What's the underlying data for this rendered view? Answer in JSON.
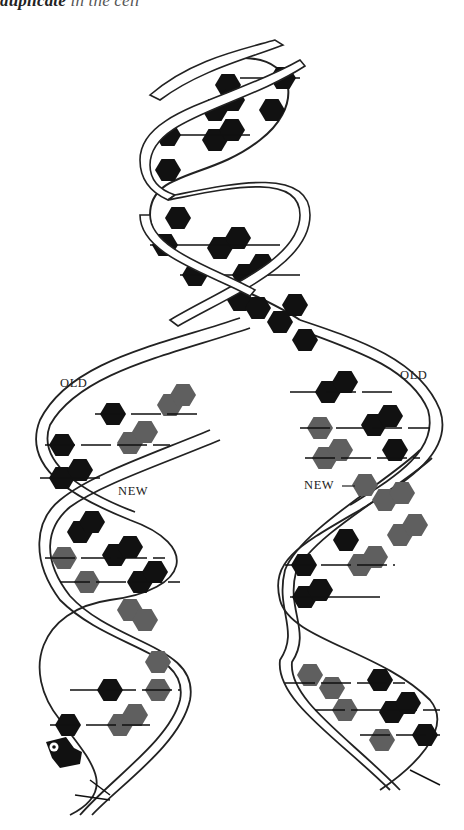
{
  "caption": {
    "bold_part": "duplicate",
    "light_part": " in the cell",
    "note": "top caption partially cropped"
  },
  "diagram": {
    "labels": {
      "old_left": "OLD",
      "old_right": "OLD",
      "new_left": "NEW",
      "new_right": "NEW"
    },
    "colors": {
      "old_base": "#111111",
      "new_base": "#5f5f5f",
      "backbone_stroke": "#222222",
      "backbone_fill": "#ffffff",
      "background": "#ffffff"
    },
    "legend": [
      {
        "label": "OLD",
        "meaning": "parental strand bases",
        "color": "#111111"
      },
      {
        "label": "NEW",
        "meaning": "newly synthesized strand bases",
        "color": "#5f5f5f"
      }
    ],
    "regions": [
      {
        "name": "parent-helix",
        "description": "original double helix, all bases black"
      },
      {
        "name": "replication-fork",
        "description": "helix unwinds into two daughter helices"
      },
      {
        "name": "left-daughter-helix",
        "description": "one old strand + one new strand"
      },
      {
        "name": "right-daughter-helix",
        "description": "one old strand + one new strand"
      },
      {
        "name": "polymerase-enzyme",
        "description": "small enzyme shape at bottom-left"
      }
    ]
  }
}
